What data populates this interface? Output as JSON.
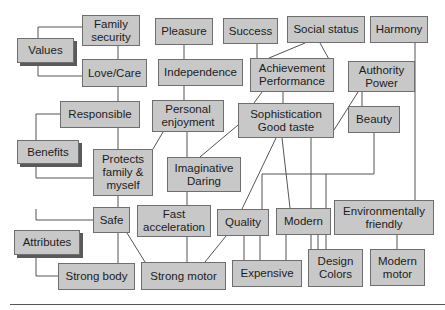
{
  "diagram": {
    "levels": [
      {
        "id": "values",
        "label": "Values",
        "x": 17,
        "y": 38,
        "w": 57,
        "h": 25
      },
      {
        "id": "benefits",
        "label": "Benefits",
        "x": 17,
        "y": 140,
        "w": 62,
        "h": 24
      },
      {
        "id": "attributes",
        "label": "Attributes",
        "x": 14,
        "y": 230,
        "w": 66,
        "h": 25
      }
    ],
    "nodes": [
      {
        "id": "family-security",
        "label": "Family\nsecurity",
        "x": 82,
        "y": 15,
        "w": 58,
        "h": 31
      },
      {
        "id": "pleasure",
        "label": "Pleasure",
        "x": 155,
        "y": 18,
        "w": 58,
        "h": 27
      },
      {
        "id": "success",
        "label": "Success",
        "x": 223,
        "y": 18,
        "w": 55,
        "h": 26
      },
      {
        "id": "social-status",
        "label": "Social status",
        "x": 287,
        "y": 16,
        "w": 78,
        "h": 27
      },
      {
        "id": "harmony",
        "label": "Harmony",
        "x": 370,
        "y": 16,
        "w": 58,
        "h": 27
      },
      {
        "id": "love-care",
        "label": "Love/Care",
        "x": 82,
        "y": 59,
        "w": 65,
        "h": 28
      },
      {
        "id": "independence",
        "label": "Independence",
        "x": 158,
        "y": 59,
        "w": 85,
        "h": 27
      },
      {
        "id": "achievement-performance",
        "label": "Achievement\nPerformance",
        "x": 250,
        "y": 58,
        "w": 84,
        "h": 34
      },
      {
        "id": "authority-power",
        "label": "Authority\nPower",
        "x": 348,
        "y": 61,
        "w": 67,
        "h": 31
      },
      {
        "id": "responsible",
        "label": "Responsible",
        "x": 60,
        "y": 101,
        "w": 80,
        "h": 27
      },
      {
        "id": "personal-enjoyment",
        "label": "Personal\nenjoyment",
        "x": 152,
        "y": 100,
        "w": 72,
        "h": 32
      },
      {
        "id": "sophistication-good-taste",
        "label": "Sophistication\nGood taste",
        "x": 238,
        "y": 103,
        "w": 96,
        "h": 35
      },
      {
        "id": "beauty",
        "label": "Beauty",
        "x": 348,
        "y": 106,
        "w": 52,
        "h": 27
      },
      {
        "id": "protects-family-myself",
        "label": "Protects\nfamily &\nmyself",
        "x": 93,
        "y": 149,
        "w": 60,
        "h": 47
      },
      {
        "id": "imaginative-daring",
        "label": "Imaginative\nDaring",
        "x": 167,
        "y": 157,
        "w": 74,
        "h": 35
      },
      {
        "id": "safe",
        "label": "Safe",
        "x": 93,
        "y": 207,
        "w": 37,
        "h": 26
      },
      {
        "id": "fast-acceleration",
        "label": "Fast\nacceleration",
        "x": 137,
        "y": 205,
        "w": 74,
        "h": 32
      },
      {
        "id": "quality",
        "label": "Quality",
        "x": 217,
        "y": 209,
        "w": 52,
        "h": 27
      },
      {
        "id": "modern",
        "label": "Modern",
        "x": 276,
        "y": 208,
        "w": 55,
        "h": 27
      },
      {
        "id": "environmentally-friendly",
        "label": "Environmentally\nfriendly",
        "x": 334,
        "y": 200,
        "w": 100,
        "h": 35
      },
      {
        "id": "strong-body",
        "label": "Strong body",
        "x": 58,
        "y": 263,
        "w": 77,
        "h": 27
      },
      {
        "id": "strong-motor",
        "label": "Strong motor",
        "x": 141,
        "y": 262,
        "w": 85,
        "h": 28
      },
      {
        "id": "expensive",
        "label": "Expensive",
        "x": 232,
        "y": 260,
        "w": 70,
        "h": 27
      },
      {
        "id": "design-colors",
        "label": "Design\nColors",
        "x": 308,
        "y": 249,
        "w": 55,
        "h": 38
      },
      {
        "id": "modern-motor",
        "label": "Modern\nmotor",
        "x": 370,
        "y": 249,
        "w": 55,
        "h": 37
      }
    ],
    "connectors": [
      {
        "points": "82,27 38,27 38,38"
      },
      {
        "points": "38,63 38,76 82,76"
      },
      {
        "points": "118,46 118,59"
      },
      {
        "points": "118,87 118,101"
      },
      {
        "points": "60,114 36,114 36,140"
      },
      {
        "points": "36,164 36,178 93,178"
      },
      {
        "points": "118,128 118,149"
      },
      {
        "points": "184,45 184,59"
      },
      {
        "points": "184,86 184,100"
      },
      {
        "points": "187,132 187,157"
      },
      {
        "points": "163,132 153,149"
      },
      {
        "points": "187,192 187,205"
      },
      {
        "points": "200,157 238,125"
      },
      {
        "points": "257,44 257,58"
      },
      {
        "points": "305,43 269,58"
      },
      {
        "points": "320,43 330,61"
      },
      {
        "points": "262,92 254,103"
      },
      {
        "points": "283,92 283,103"
      },
      {
        "points": "362,92 362,106"
      },
      {
        "points": "358,92 334,130"
      },
      {
        "points": "415,43 415,200"
      },
      {
        "points": "118,196 118,207"
      },
      {
        "points": "36,209 36,220 93,220"
      },
      {
        "points": "36,255 36,276 58,276"
      },
      {
        "points": "118,233 118,263"
      },
      {
        "points": "127,233 145,262"
      },
      {
        "points": "187,237 187,262"
      },
      {
        "points": "226,236 205,262"
      },
      {
        "points": "276,138 242,209"
      },
      {
        "points": "282,138 290,208"
      },
      {
        "points": "311,138 311,249"
      },
      {
        "points": "374,133 374,174 262,174 262,209"
      },
      {
        "points": "326,174 326,249"
      },
      {
        "points": "244,236 244,260"
      },
      {
        "points": "260,236 260,260"
      },
      {
        "points": "286,235 286,260"
      },
      {
        "points": "318,235 318,249"
      },
      {
        "points": "397,235 397,249"
      }
    ],
    "colors": {
      "box_fill": "#c8c8c8",
      "box_border": "#6e6e6e",
      "line": "#555555",
      "shadow": "#5a5a5a"
    }
  }
}
